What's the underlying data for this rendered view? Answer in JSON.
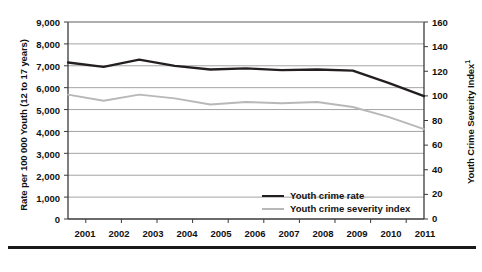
{
  "chart_data": {
    "type": "line",
    "title": "",
    "subtitle": "",
    "xlabel": "",
    "ylabel": "Rate per 100 000 Youth (12 to 17 years)",
    "y2label": "Youth Crime Severity Index",
    "y2label_footnote": "1",
    "categories": [
      "2001",
      "2002",
      "2003",
      "2004",
      "2005",
      "2006",
      "2007",
      "2008",
      "2009",
      "2010",
      "2011"
    ],
    "ylim": [
      0,
      9000
    ],
    "yticks": [
      "0",
      "1,000",
      "2,000",
      "3,000",
      "4,000",
      "5,000",
      "6,000",
      "7,000",
      "8,000",
      "9,000"
    ],
    "ytick_values": [
      0,
      1000,
      2000,
      3000,
      4000,
      5000,
      6000,
      7000,
      8000,
      9000
    ],
    "y2lim": [
      0,
      160
    ],
    "y2ticks": [
      "0",
      "20",
      "40",
      "60",
      "80",
      "100",
      "120",
      "140",
      "160"
    ],
    "y2tick_values": [
      0,
      20,
      40,
      60,
      80,
      100,
      120,
      140,
      160
    ],
    "grid": true,
    "grid_axis": "y",
    "legend_position": "inside-bottom-right",
    "series": [
      {
        "name": "Youth crime rate",
        "axis": "left",
        "color": "#231f20",
        "values": [
          7150,
          6950,
          7280,
          7000,
          6830,
          6880,
          6800,
          6830,
          6780,
          6220,
          5610
        ]
      },
      {
        "name": "Youth crime severity index",
        "axis": "right",
        "color": "#b8b8b8",
        "values": [
          101,
          96,
          101,
          98,
          93,
          95,
          94,
          95,
          91,
          83,
          73
        ]
      }
    ]
  },
  "legend": {
    "items": [
      {
        "label": "Youth crime rate"
      },
      {
        "label": "Youth crime severity index"
      }
    ]
  }
}
